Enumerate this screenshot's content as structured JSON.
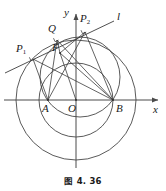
{
  "figure": {
    "caption": "图 4. 36",
    "stroke_color": "#3c3c3c",
    "axis_color": "#4a4a4a",
    "text_color": "#1a1a1a",
    "background": "#ffffff"
  },
  "axes": {
    "x_label": "x",
    "y_label": "y",
    "origin_label": "O",
    "origin_px": {
      "x": 76,
      "y": 100
    },
    "x_axis_from_px": {
      "x": 4,
      "y": 100
    },
    "x_axis_to_px": {
      "x": 160,
      "y": 100
    },
    "y_axis_from_px": {
      "x": 76,
      "y": 168
    },
    "y_axis_to_px": {
      "x": 76,
      "y": 12
    }
  },
  "points": [
    {
      "name": "A",
      "label": "A",
      "sub": "",
      "px": {
        "x": 48,
        "y": 100
      },
      "label_px": {
        "x": 43,
        "y": 104
      }
    },
    {
      "name": "B",
      "label": "B",
      "sub": "",
      "px": {
        "x": 113,
        "y": 100
      },
      "label_px": {
        "x": 115,
        "y": 104
      }
    },
    {
      "name": "O",
      "label": "O",
      "sub": "",
      "px": {
        "x": 76,
        "y": 100
      },
      "label_px": {
        "x": 69,
        "y": 104
      }
    },
    {
      "name": "P1",
      "label": "P",
      "sub": "1",
      "px": {
        "x": 33,
        "y": 59
      },
      "label_px": {
        "x": 18,
        "y": 44
      }
    },
    {
      "name": "P2",
      "label": "P",
      "sub": "2",
      "px": {
        "x": 85,
        "y": 32
      },
      "label_px": {
        "x": 81,
        "y": 14
      }
    },
    {
      "name": "Q",
      "label": "Q",
      "sub": "",
      "px": {
        "x": 57,
        "y": 40
      },
      "label_px": {
        "x": 49,
        "y": 24
      }
    },
    {
      "name": "F",
      "label": "F",
      "sub": "",
      "px": {
        "x": 60,
        "y": 53
      },
      "label_px": {
        "x": 53,
        "y": 44
      }
    }
  ],
  "line_label": "l",
  "line_label_px": {
    "x": 117,
    "y": 12
  },
  "line_l": {
    "from_px": {
      "x": 5,
      "y": 73
    },
    "to_px": {
      "x": 114,
      "y": 21
    }
  },
  "circles": [
    {
      "name": "outer-circle",
      "cx": 76,
      "cy": 100,
      "r": 60
    },
    {
      "name": "middle-circle",
      "cx": 76,
      "cy": 100,
      "r": 37
    },
    {
      "name": "ab-circle",
      "cx": 80,
      "cy": 77,
      "r": 40
    }
  ],
  "segments": [
    {
      "name": "A-to-P1",
      "from": {
        "x": 48,
        "y": 100
      },
      "to": {
        "x": 33,
        "y": 59
      }
    },
    {
      "name": "A-to-Q",
      "from": {
        "x": 48,
        "y": 100
      },
      "to": {
        "x": 57,
        "y": 40
      }
    },
    {
      "name": "A-to-P2",
      "from": {
        "x": 48,
        "y": 100
      },
      "to": {
        "x": 85,
        "y": 32
      }
    },
    {
      "name": "B-to-P1",
      "from": {
        "x": 113,
        "y": 100
      },
      "to": {
        "x": 33,
        "y": 59
      }
    },
    {
      "name": "B-to-Q",
      "from": {
        "x": 113,
        "y": 100
      },
      "to": {
        "x": 57,
        "y": 40
      }
    },
    {
      "name": "B-to-P2",
      "from": {
        "x": 113,
        "y": 100
      },
      "to": {
        "x": 85,
        "y": 32
      }
    },
    {
      "name": "B-to-F",
      "from": {
        "x": 113,
        "y": 100
      },
      "to": {
        "x": 60,
        "y": 53
      }
    },
    {
      "name": "O-to-F",
      "from": {
        "x": 76,
        "y": 100
      },
      "to": {
        "x": 60,
        "y": 53
      }
    },
    {
      "name": "F-to-Q",
      "from": {
        "x": 60,
        "y": 53
      },
      "to": {
        "x": 57,
        "y": 40
      }
    },
    {
      "name": "F-to-P2",
      "from": {
        "x": 60,
        "y": 53
      },
      "to": {
        "x": 85,
        "y": 32
      }
    }
  ],
  "right_angle_marks": [
    {
      "name": "right-angle-at-P1",
      "px": {
        "x": 33,
        "y": 59
      }
    },
    {
      "name": "right-angle-at-Q",
      "px": {
        "x": 57,
        "y": 40
      }
    },
    {
      "name": "right-angle-at-P2",
      "px": {
        "x": 85,
        "y": 32
      }
    }
  ]
}
